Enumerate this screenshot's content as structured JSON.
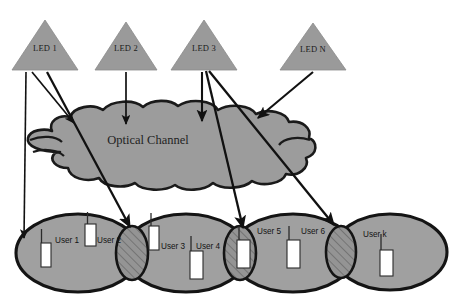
{
  "canvas": {
    "width": 451,
    "height": 308,
    "background": "#ffffff"
  },
  "colors": {
    "shape_fill": "#9a9a9a",
    "shape_stroke": "#1a1a1a",
    "cloud_fill": "#9c9c9c",
    "cell_fill": "#a0a0a0",
    "overlap_fill": "#8f8f8f",
    "hatch_stroke": "#5a5a5a",
    "device_fill": "#ffffff",
    "device_stroke": "#2b2b2b",
    "arrow_stroke": "#111111",
    "text": "#1a1a1a"
  },
  "transmitters": {
    "group_name": "led-transmitters",
    "items": [
      {
        "id": "led-1",
        "label": "LED 1",
        "cx": 45,
        "apex_y": 20,
        "base_y": 70,
        "half_width": 33
      },
      {
        "id": "led-2",
        "label": "LED 2",
        "cx": 126,
        "apex_y": 22,
        "base_y": 70,
        "half_width": 31
      },
      {
        "id": "led-3",
        "label": "LED 3",
        "cx": 204,
        "apex_y": 20,
        "base_y": 70,
        "half_width": 33
      },
      {
        "id": "led-n",
        "label": "LED N",
        "cx": 313,
        "apex_y": 23,
        "base_y": 70,
        "half_width": 33
      }
    ]
  },
  "channel": {
    "label": "Optical Channel",
    "label_x": 148,
    "label_y": 144
  },
  "cells": {
    "group_name": "coverage-cells",
    "items": [
      {
        "id": "cell-1",
        "cx": 78,
        "cy": 253,
        "rx": 62,
        "ry": 39
      },
      {
        "id": "cell-2",
        "cx": 186,
        "cy": 253,
        "rx": 62,
        "ry": 39
      },
      {
        "id": "cell-3",
        "cx": 293,
        "cy": 253,
        "rx": 62,
        "ry": 39
      },
      {
        "id": "cell-4",
        "cx": 390,
        "cy": 252,
        "rx": 57,
        "ry": 38
      }
    ]
  },
  "overlaps": {
    "group_name": "cell-overlap-regions",
    "items": [
      {
        "id": "overlap-1-2",
        "cx": 132,
        "cy": 253,
        "rx": 16,
        "ry": 27
      },
      {
        "id": "overlap-2-3",
        "cx": 240,
        "cy": 253,
        "rx": 16,
        "ry": 27
      },
      {
        "id": "overlap-3-4",
        "cx": 341,
        "cy": 252,
        "rx": 15,
        "ry": 26
      }
    ]
  },
  "users": {
    "group_name": "user-devices",
    "items": [
      {
        "id": "user-1",
        "label": "User 1",
        "label_x": 52,
        "label_y": 242,
        "dev_x": 41,
        "dev_y": 243,
        "dev_w": 10,
        "dev_h": 24,
        "ant_h": 14
      },
      {
        "id": "user-2",
        "label": "User 2",
        "label_x": 95,
        "label_y": 242,
        "dev_x": 87,
        "dev_y": 224,
        "dev_w": 10,
        "dev_h": 22,
        "ant_h": 12
      },
      {
        "id": "user-3",
        "label": "User 3",
        "label_x": 160,
        "label_y": 248,
        "dev_x": 150,
        "dev_y": 226,
        "dev_w": 10,
        "dev_h": 24,
        "ant_h": 13
      },
      {
        "id": "user-4",
        "label": "User 4",
        "label_x": 196,
        "label_y": 248,
        "dev_x": 190,
        "dev_y": 251,
        "dev_w": 12,
        "dev_h": 28,
        "ant_h": 15
      },
      {
        "id": "user-5",
        "label": "User 5",
        "label_x": 258,
        "label_y": 233,
        "dev_x": 238,
        "dev_y": 240,
        "dev_w": 12,
        "dev_h": 28,
        "ant_h": 14
      },
      {
        "id": "user-6",
        "label": "User 6",
        "label_x": 300,
        "label_y": 233,
        "dev_x": 288,
        "dev_y": 240,
        "dev_w": 12,
        "dev_h": 28,
        "ant_h": 14
      },
      {
        "id": "user-k",
        "label": "User k",
        "label_x": 362,
        "label_y": 236,
        "dev_x": 380,
        "dev_y": 250,
        "dev_w": 12,
        "dev_h": 26,
        "ant_h": 16
      }
    ]
  },
  "links": {
    "group_name": "optical-links",
    "items": [
      {
        "id": "link-led1-to-user1",
        "from": "LED 1",
        "to": "User 1 cell",
        "x1": 26,
        "y1": 72,
        "x2": 24,
        "y2": 240,
        "width": 1.6
      },
      {
        "id": "link-led1-to-channel",
        "from": "LED 1",
        "to": "Optical Channel",
        "x1": 32,
        "y1": 72,
        "x2": 75,
        "y2": 125,
        "width": 1.6
      },
      {
        "id": "link-led1-to-overlap12",
        "from": "LED 1",
        "to": "Overlap 1-2",
        "x1": 47,
        "y1": 72,
        "x2": 131,
        "y2": 229,
        "width": 2.2
      },
      {
        "id": "link-led2-to-channel",
        "from": "LED 2",
        "to": "Optical Channel",
        "x1": 126,
        "y1": 72,
        "x2": 126,
        "y2": 127,
        "width": 1.6
      },
      {
        "id": "link-led3-to-channel",
        "from": "LED 3",
        "to": "Optical Channel",
        "x1": 202,
        "y1": 72,
        "x2": 202,
        "y2": 123,
        "width": 2.0
      },
      {
        "id": "link-led3-to-overlap23",
        "from": "LED 3",
        "to": "Overlap 2-3",
        "x1": 206,
        "y1": 71,
        "x2": 244,
        "y2": 230,
        "width": 2.2
      },
      {
        "id": "link-led3-to-overlap34",
        "from": "LED 3",
        "to": "Overlap 3-4",
        "x1": 208,
        "y1": 71,
        "x2": 336,
        "y2": 227,
        "width": 2.2
      },
      {
        "id": "link-ledn-to-channel",
        "from": "LED N",
        "to": "Optical Channel",
        "x1": 313,
        "y1": 72,
        "x2": 256,
        "y2": 120,
        "width": 2.0
      }
    ]
  }
}
